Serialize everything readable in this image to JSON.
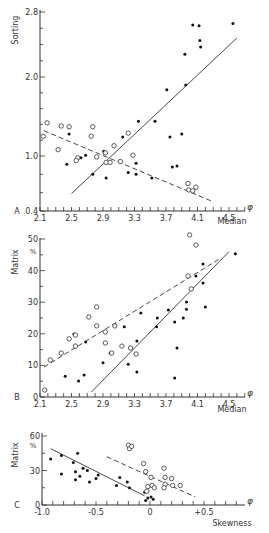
{
  "chart_data": [
    {
      "panel": "A",
      "type": "scatter",
      "title": "",
      "xlabel": "Median",
      "ylabel": "Sorting",
      "x_unit": "φ",
      "xlim": [
        2.1,
        4.7
      ],
      "ylim": [
        0.4,
        2.8
      ],
      "xticks": [
        "2.1",
        "2.5",
        "2.9",
        "3.3",
        "3.7",
        "4.1",
        "4.5"
      ],
      "yticks": [
        "0.4",
        "1.0",
        "2.0",
        "2.8"
      ],
      "grid": false,
      "series": [
        {
          "name": "filled",
          "marker": "filled-circle",
          "points": [
            [
              2.44,
              0.91
            ],
            [
              2.47,
              1.28
            ],
            [
              2.68,
              1.01
            ],
            [
              2.62,
              0.98
            ],
            [
              2.77,
              0.8
            ],
            [
              2.94,
              0.76
            ],
            [
              2.91,
              1.06
            ],
            [
              3.15,
              1.24
            ],
            [
              3.35,
              1.44
            ],
            [
              3.22,
              0.82
            ],
            [
              3.32,
              0.92
            ],
            [
              3.32,
              0.8
            ],
            [
              3.52,
              0.76
            ],
            [
              3.56,
              1.44
            ],
            [
              3.71,
              1.84
            ],
            [
              3.75,
              1.24
            ],
            [
              3.9,
              1.28
            ],
            [
              3.78,
              0.88
            ],
            [
              3.84,
              0.89
            ],
            [
              3.94,
              2.28
            ],
            [
              3.95,
              1.9
            ],
            [
              4.04,
              2.64
            ],
            [
              4.12,
              2.63
            ],
            [
              4.13,
              2.45
            ],
            [
              4.14,
              2.37
            ],
            [
              4.55,
              2.66
            ]
          ]
        },
        {
          "name": "open",
          "marker": "open-circle",
          "points": [
            [
              2.14,
              1.25
            ],
            [
              2.19,
              1.42
            ],
            [
              2.33,
              1.08
            ],
            [
              2.37,
              1.38
            ],
            [
              2.47,
              1.37
            ],
            [
              2.58,
              0.98
            ],
            [
              2.56,
              0.95
            ],
            [
              2.75,
              1.25
            ],
            [
              2.77,
              1.37
            ],
            [
              2.82,
              0.99
            ],
            [
              2.93,
              1.04
            ],
            [
              2.94,
              0.93
            ],
            [
              2.99,
              0.93
            ],
            [
              3.04,
              1.13
            ],
            [
              3.12,
              0.94
            ],
            [
              3.22,
              1.29
            ],
            [
              3.28,
              1.01
            ],
            [
              3.98,
              0.7
            ],
            [
              4.08,
              0.66
            ],
            [
              3.99,
              0.63
            ],
            [
              4.04,
              0.62
            ]
          ]
        }
      ],
      "lines": [
        {
          "name": "filled-trend",
          "style": "solid",
          "from": [
            2.5,
            0.59
          ],
          "to": [
            4.6,
            2.48
          ]
        },
        {
          "name": "open-trend",
          "style": "dashed",
          "from": [
            2.15,
            1.32
          ],
          "to": [
            4.3,
            0.5
          ]
        }
      ]
    },
    {
      "panel": "B",
      "type": "scatter",
      "title": "",
      "xlabel": "Median",
      "ylabel": "Matrix %",
      "x_unit": "φ",
      "xlim": [
        2.1,
        4.7
      ],
      "ylim": [
        0,
        50
      ],
      "xticks": [
        "2.1",
        "2.5",
        "2.9",
        "3.3",
        "3.7",
        "4.1",
        "4.5"
      ],
      "yticks": [
        "0",
        "10",
        "20",
        "30",
        "40",
        "50"
      ],
      "grid": false,
      "series": [
        {
          "name": "filled",
          "marker": "filled-circle",
          "points": [
            [
              2.42,
              6.6
            ],
            [
              2.59,
              5.1
            ],
            [
              2.66,
              7.0
            ],
            [
              2.53,
              19.9
            ],
            [
              2.68,
              17.4
            ],
            [
              2.9,
              10.8
            ],
            [
              2.99,
              13.9
            ],
            [
              3.17,
              22.2
            ],
            [
              3.22,
              10.4
            ],
            [
              3.33,
              17.7
            ],
            [
              3.38,
              26.6
            ],
            [
              3.33,
              7.9
            ],
            [
              3.59,
              25.0
            ],
            [
              3.58,
              22.2
            ],
            [
              3.73,
              27.5
            ],
            [
              3.81,
              23.7
            ],
            [
              3.84,
              15.5
            ],
            [
              3.81,
              6.0
            ],
            [
              3.92,
              25.0
            ],
            [
              3.96,
              30.1
            ],
            [
              3.96,
              27.8
            ],
            [
              4.08,
              38.3
            ],
            [
              4.17,
              42.1
            ],
            [
              4.17,
              36.1
            ],
            [
              4.2,
              28.5
            ],
            [
              4.58,
              45.3
            ]
          ]
        },
        {
          "name": "open",
          "marker": "open-circle",
          "points": [
            [
              2.16,
              2.2
            ],
            [
              2.23,
              11.7
            ],
            [
              2.37,
              13.9
            ],
            [
              2.47,
              18.4
            ],
            [
              2.55,
              19.6
            ],
            [
              2.55,
              16.1
            ],
            [
              2.72,
              25.3
            ],
            [
              2.82,
              28.5
            ],
            [
              2.82,
              22.5
            ],
            [
              2.93,
              20.6
            ],
            [
              2.93,
              17.1
            ],
            [
              3.01,
              13.9
            ],
            [
              3.05,
              22.5
            ],
            [
              3.14,
              16.1
            ],
            [
              3.25,
              15.5
            ],
            [
              3.32,
              13.6
            ],
            [
              3.98,
              38.3
            ],
            [
              4.02,
              34.2
            ],
            [
              4.0,
              51.3
            ],
            [
              4.08,
              48.1
            ]
          ]
        }
      ],
      "lines": [
        {
          "name": "filled-trend",
          "style": "solid",
          "from": [
            2.75,
            1.5
          ],
          "to": [
            4.5,
            46
          ]
        },
        {
          "name": "open-trend",
          "style": "dashed",
          "from": [
            2.15,
            9.5
          ],
          "to": [
            4.4,
            44
          ]
        }
      ]
    },
    {
      "panel": "C",
      "type": "scatter",
      "title": "",
      "xlabel": "Skewness",
      "ylabel": "Matrix %",
      "x_unit": "φ",
      "xlim": [
        -1.0,
        0.9
      ],
      "ylim": [
        0,
        60
      ],
      "xticks": [
        "-1.0",
        "-0.5",
        "0",
        "+0.5"
      ],
      "yticks": [
        "0",
        "30",
        "60"
      ],
      "grid": false,
      "series": [
        {
          "name": "filled",
          "marker": "filled-circle",
          "points": [
            [
              -0.92,
              40
            ],
            [
              -0.82,
              43
            ],
            [
              -0.82,
              27
            ],
            [
              -0.71,
              37
            ],
            [
              -0.69,
              29
            ],
            [
              -0.69,
              22
            ],
            [
              -0.67,
              45
            ],
            [
              -0.65,
              25
            ],
            [
              -0.62,
              32
            ],
            [
              -0.58,
              30
            ],
            [
              -0.56,
              20
            ],
            [
              -0.5,
              23
            ],
            [
              -0.48,
              26
            ],
            [
              -0.31,
              17
            ],
            [
              -0.28,
              24
            ],
            [
              -0.21,
              20
            ],
            [
              -0.19,
              15
            ],
            [
              -0.05,
              11
            ],
            [
              -0.04,
              4
            ],
            [
              -0.02,
              6
            ],
            [
              0.01,
              7
            ],
            [
              0.03,
              5
            ]
          ]
        },
        {
          "name": "open",
          "marker": "open-circle",
          "points": [
            [
              -0.2,
              52
            ],
            [
              -0.19,
              49
            ],
            [
              -0.17,
              51
            ],
            [
              -0.06,
              36
            ],
            [
              -0.04,
              29
            ],
            [
              -0.02,
              16
            ],
            [
              -0.03,
              12
            ],
            [
              0.01,
              24
            ],
            [
              0.02,
              17
            ],
            [
              0.04,
              15
            ],
            [
              0.13,
              32
            ],
            [
              0.14,
              24
            ],
            [
              0.14,
              18
            ],
            [
              0.13,
              15
            ],
            [
              0.2,
              23
            ],
            [
              0.21,
              17
            ],
            [
              0.28,
              17
            ]
          ]
        }
      ],
      "lines": [
        {
          "name": "filled-trend",
          "style": "solid",
          "from": [
            -0.92,
            49
          ],
          "to": [
            -0.05,
            8
          ]
        },
        {
          "name": "open-trend",
          "style": "dashed",
          "from": [
            -0.4,
            42
          ],
          "to": [
            0.42,
            7
          ]
        }
      ]
    }
  ]
}
